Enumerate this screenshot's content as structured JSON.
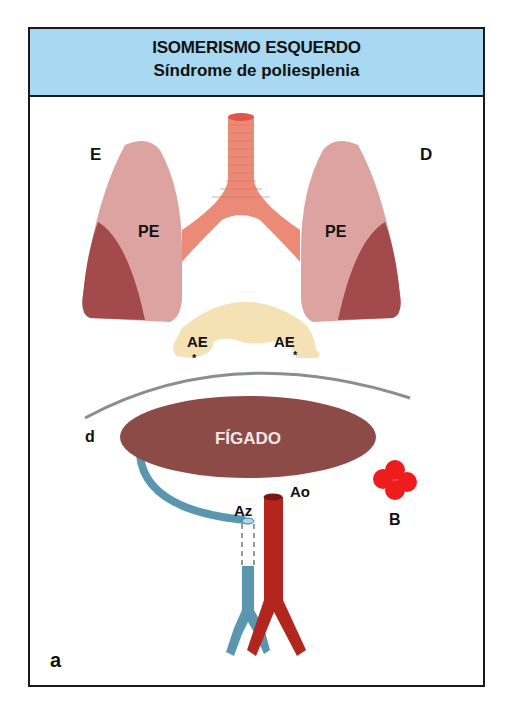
{
  "header": {
    "title": "ISOMERISMO ESQUERDO",
    "subtitle": "Síndrome de poliesplenia",
    "background": "#a9d8f2"
  },
  "diagram": {
    "side_labels": {
      "left": "E",
      "right": "D"
    },
    "lungs": {
      "left_label": "PE",
      "right_label": "PE",
      "color": "#dca3a0",
      "lobe_color": "#a34a4c"
    },
    "trachea_color": "#ec8a78",
    "atria": {
      "left_label": "AE",
      "right_label": "AE",
      "marker": "*",
      "color": "#f4e1b4"
    },
    "diaphragm_label": "d",
    "liver": {
      "label": "FÍGADO",
      "color": "#8c4b46"
    },
    "vessels": {
      "azygos_label": "Az",
      "aorta_label": "Ao",
      "azygos_color": "#5a96ad",
      "aorta_color": "#b3261e"
    },
    "spleen": {
      "label": "B",
      "color": "#ee1c1c"
    },
    "panel_label": "a"
  }
}
